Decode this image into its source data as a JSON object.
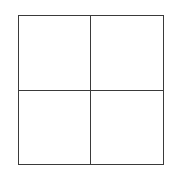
{
  "diagram": {
    "type": "grid",
    "rows": 2,
    "columns": 2,
    "line_color": "#3a3a3a",
    "background_color": "#ffffff",
    "cells": [
      {
        "row": 0,
        "col": 0,
        "label": ""
      },
      {
        "row": 0,
        "col": 1,
        "label": ""
      },
      {
        "row": 1,
        "col": 0,
        "label": ""
      },
      {
        "row": 1,
        "col": 1,
        "label": ""
      }
    ]
  }
}
